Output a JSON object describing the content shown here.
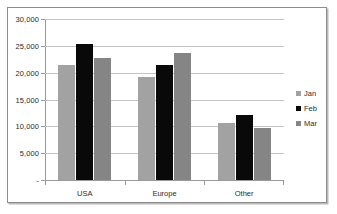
{
  "chart_data": {
    "type": "bar",
    "title": "",
    "xlabel": "",
    "ylabel": "",
    "categories": [
      "USA",
      "Europe",
      "Other"
    ],
    "series": [
      {
        "name": "Jan",
        "color": "#a2a2a2",
        "values": [
          21500,
          19200,
          10700
        ]
      },
      {
        "name": "Feb",
        "color": "#090909",
        "values": [
          25400,
          21400,
          12200
        ]
      },
      {
        "name": "Mar",
        "color": "#858585",
        "values": [
          22700,
          23600,
          9600
        ]
      }
    ],
    "ylim": [
      0,
      30000
    ],
    "yticks": [
      0,
      5000,
      10000,
      15000,
      20000,
      25000,
      30000
    ],
    "ytick_labels": [
      "-",
      "5,000",
      "10,000",
      "15,000",
      "20,000",
      "25,000",
      "30,000"
    ],
    "grid": true,
    "legend_position": "right"
  },
  "legend": {
    "entries": [
      {
        "label": "Jan"
      },
      {
        "label": "Feb"
      },
      {
        "label": "Mar"
      }
    ]
  }
}
